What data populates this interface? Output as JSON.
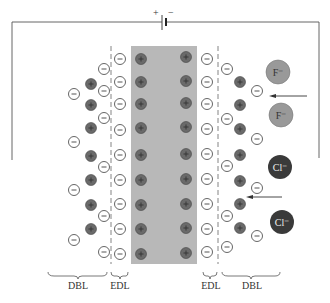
{
  "diagram": {
    "battery": {
      "plus": "+",
      "minus": "−"
    },
    "labels": {
      "left_dbl": "DBL",
      "left_edl": "EDL",
      "right_edl": "EDL",
      "right_dbl": "DBL"
    },
    "ions": {
      "fluoride_1": "F⁻",
      "fluoride_2": "F⁻",
      "chloride_1": "Cl⁻",
      "chloride_2": "Cl⁻"
    },
    "colors": {
      "electrode": "#b8b8b8",
      "positive_charge": "#6a6a6a",
      "fluoride": "#999999",
      "chloride": "#3a3a3a",
      "wire": "#555555"
    }
  }
}
